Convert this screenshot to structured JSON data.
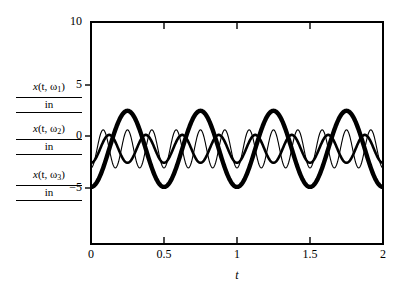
{
  "chart_data": {
    "type": "line",
    "title": "",
    "xlabel": "t",
    "ylabel": "x (t, ω) / in",
    "xlim": [
      0,
      2
    ],
    "ylim": [
      -7.5,
      10
    ],
    "grid": false,
    "legend": "none",
    "xticks": [
      "0",
      "0.5",
      "1",
      "1.5",
      "2"
    ],
    "xtick_values": [
      0,
      0.5,
      1,
      1.5,
      2
    ],
    "yticks": [
      "10",
      "5",
      "0",
      "-5"
    ],
    "ytick_values": [
      10,
      5,
      0,
      -5
    ],
    "series": [
      {
        "name": "x (t, ω₁) / in",
        "linewidth": "thick",
        "color": "#000000",
        "amplitude": 3.0,
        "frequency_cycles_per_unit_t": 2.0,
        "phase_deg": -90,
        "description": "large amplitude, lowest frequency, drawn with the heaviest stroke"
      },
      {
        "name": "x (t, ω₂) / in",
        "linewidth": "medium",
        "color": "#000000",
        "amplitude": 1.1,
        "frequency_cycles_per_unit_t": 4.0,
        "phase_deg": -90,
        "description": "medium amplitude, mid frequency, medium stroke"
      },
      {
        "name": "x (t, ω₃) / in",
        "linewidth": "thin",
        "color": "#000000",
        "amplitude": 1.5,
        "frequency_cycles_per_unit_t": 6.0,
        "phase_deg": -90,
        "description": "small amplitude, highest frequency, hairline stroke"
      }
    ]
  },
  "axis": {
    "x_name": "t",
    "y_ticks": [
      {
        "label": "10",
        "value": 10
      },
      {
        "label": "5",
        "value": 5
      },
      {
        "label": "0",
        "value": 0
      },
      {
        "label": "−5",
        "value": -5
      }
    ],
    "x_ticks": [
      {
        "label": "0",
        "value": 0
      },
      {
        "label": "0.5",
        "value": 0.5
      },
      {
        "label": "1",
        "value": 1
      },
      {
        "label": "1.5",
        "value": 1.5
      },
      {
        "label": "2",
        "value": 2
      }
    ]
  },
  "y_labels": [
    {
      "numerator_x": "x",
      "numerator_rest": "(t, ω",
      "sub": "1",
      "numerator_close": ")",
      "denominator": "in"
    },
    {
      "numerator_x": "x",
      "numerator_rest": "(t, ω",
      "sub": "2",
      "numerator_close": ")",
      "denominator": "in"
    },
    {
      "numerator_x": "x",
      "numerator_rest": "(t, ω",
      "sub": "3",
      "numerator_close": ")",
      "denominator": "in"
    }
  ],
  "colors": {
    "ink": "#000000",
    "background": "#ffffff"
  }
}
